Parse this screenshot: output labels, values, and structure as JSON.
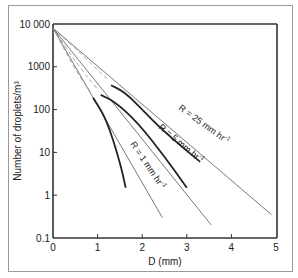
{
  "chart_data": {
    "type": "line",
    "title": "",
    "xlabel": "D (mm)",
    "ylabel": "Number of droplets/m³",
    "xlim": [
      0,
      5
    ],
    "ylim": [
      0.1,
      10000
    ],
    "yscale": "log",
    "grid": false,
    "legend": "inline labels on curves",
    "x_ticks": [
      "0",
      "1",
      "2",
      "3",
      "4",
      "5"
    ],
    "y_ticks": [
      "0.1",
      "1",
      "10",
      "100",
      "1000",
      "10 000"
    ],
    "series": [
      {
        "name": "R = 25 mm hr⁻¹",
        "label": "R = 25 mm hr",
        "label_sup": "-1",
        "exponential_fit": {
          "x": [
            0,
            4.9
          ],
          "y": [
            8000,
            0.35
          ]
        },
        "measured": {
          "x": [
            1.3,
            1.6,
            2.0,
            2.5,
            3.3
          ],
          "y": [
            370,
            260,
            100,
            30,
            6
          ]
        }
      },
      {
        "name": "R = 5 mm hr⁻¹",
        "label": "R = 5 mm hr",
        "label_sup": "-1",
        "exponential_fit": {
          "x": [
            0,
            3.55
          ],
          "y": [
            8000,
            0.2
          ]
        },
        "measured": {
          "x": [
            1.07,
            1.4,
            1.9,
            2.5,
            3.0
          ],
          "y": [
            220,
            150,
            50,
            8,
            1.5
          ]
        }
      },
      {
        "name": "R = 1 mm hr⁻¹",
        "label": "R = 1 mm hr",
        "label_sup": "-1",
        "exponential_fit": {
          "x": [
            0,
            2.45
          ],
          "y": [
            8000,
            0.3
          ]
        },
        "measured": {
          "x": [
            0.9,
            1.2,
            1.5,
            1.63
          ],
          "y": [
            190,
            60,
            6,
            1.5
          ]
        }
      }
    ],
    "dashed_series_note": "Dashed curves (gamma-type fits) accompany each measured curve"
  }
}
